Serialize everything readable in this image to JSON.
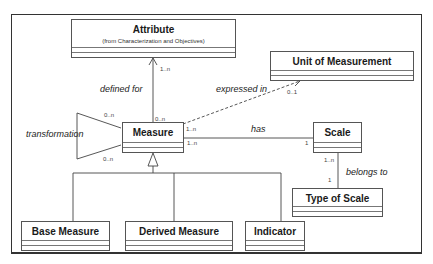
{
  "diagram": {
    "type": "uml-class-diagram",
    "classes": {
      "attribute": {
        "name": "Attribute",
        "stereotype": "(from Characterization and Objectives)"
      },
      "unit_of_measurement": {
        "name": "Unit of Measurement"
      },
      "measure": {
        "name": "Measure"
      },
      "scale": {
        "name": "Scale"
      },
      "type_of_scale": {
        "name": "Type of Scale"
      },
      "base_measure": {
        "name": "Base Measure"
      },
      "derived_measure": {
        "name": "Derived Measure"
      },
      "indicator": {
        "name": "Indicator"
      }
    },
    "associations": {
      "defined_for": {
        "label": "defined for",
        "from": "Measure",
        "to": "Attribute",
        "mult_source": "0..n",
        "mult_target": "1..n",
        "style": "solid-open-arrow"
      },
      "expressed_in": {
        "label": "expressed in",
        "from": "Measure",
        "to": "Unit of Measurement",
        "mult_source": "1..n",
        "mult_target": "0..1",
        "style": "dashed-open-arrow"
      },
      "has": {
        "label": "has",
        "from": "Measure",
        "to": "Scale",
        "mult_source": "1..n",
        "mult_target": "1",
        "style": "solid"
      },
      "belongs_to": {
        "label": "belongs to",
        "from": "Scale",
        "to": "Type of Scale",
        "mult_source": "1..n",
        "mult_target": "1",
        "style": "solid"
      },
      "transformation": {
        "label": "transformation",
        "from": "Measure",
        "to": "Measure",
        "mult_source": "0..n",
        "mult_target": "0..n",
        "style": "self-association"
      }
    },
    "generalization": {
      "parent": "Measure",
      "children": [
        "Base Measure",
        "Derived Measure",
        "Indicator"
      ]
    }
  }
}
